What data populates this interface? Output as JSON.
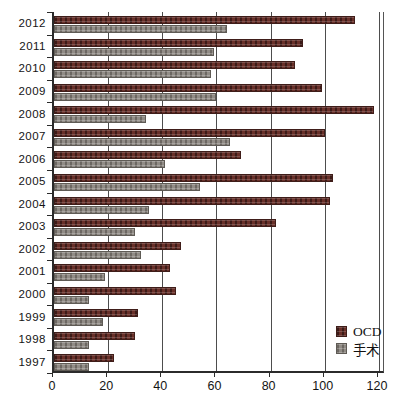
{
  "chart_data": {
    "type": "bar",
    "orientation": "horizontal",
    "order": "top-to-bottom",
    "categories": [
      "2012",
      "2011",
      "2010",
      "2009",
      "2008",
      "2007",
      "2006",
      "2005",
      "2004",
      "2003",
      "2002",
      "2001",
      "2000",
      "1999",
      "1998",
      "1997"
    ],
    "series": [
      {
        "name": "OCD",
        "color": "#693029",
        "values": [
          111,
          92,
          89,
          99,
          118,
          100,
          69,
          103,
          102,
          82,
          47,
          43,
          45,
          31,
          30,
          22
        ]
      },
      {
        "name": "手术",
        "color": "#918c86",
        "values": [
          64,
          59,
          58,
          60,
          34,
          65,
          41,
          54,
          35,
          30,
          32,
          19,
          13,
          18,
          13,
          13
        ]
      }
    ],
    "title": "",
    "xlabel": "",
    "ylabel": "",
    "xlim": [
      0,
      120
    ],
    "xticks": [
      0,
      20,
      40,
      60,
      80,
      100,
      120
    ],
    "xtick_labels": [
      "0",
      "20",
      "40",
      "60",
      "80",
      "100",
      "120"
    ],
    "grid": true,
    "legend_position": "inside-bottom-right"
  },
  "legend": {
    "items": [
      {
        "label": "OCD",
        "color": "#693029"
      },
      {
        "label": "手术",
        "color": "#918c86"
      }
    ]
  },
  "colors": {
    "ocd_bar": "#693029",
    "surgery_bar": "#918c86",
    "gridline": "#4d4d4d",
    "axis": "#2b2b2b",
    "text": "#141414",
    "background": "#ffffff"
  }
}
